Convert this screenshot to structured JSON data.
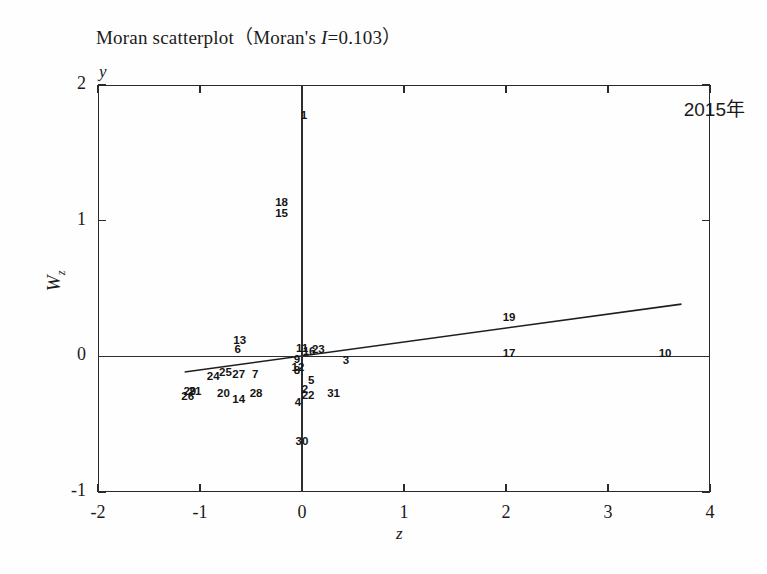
{
  "figure": {
    "title_prefix": "Moran scatterplot",
    "title_open_paren": "（",
    "title_moran": "Moran's ",
    "title_italic_i": "I",
    "title_value": "=0.103",
    "title_close_paren": "）",
    "year_annotation": "2015年",
    "y_corner_letter": "y",
    "x_corner_letter": "z",
    "ylabel_main": "W",
    "ylabel_sub": "z"
  },
  "chart_data": {
    "type": "scatter",
    "title": "Moran scatterplot（Moran's I=0.103）",
    "xlabel": "z",
    "ylabel": "Wz",
    "xlim": [
      -2,
      4
    ],
    "ylim": [
      -1,
      2
    ],
    "xticks": [
      "-2",
      "-1",
      "0",
      "1",
      "2",
      "3",
      "4"
    ],
    "xtick_values": [
      -2,
      -1,
      0,
      1,
      2,
      3,
      4
    ],
    "yticks": [
      "2",
      "1",
      "0",
      "-1"
    ],
    "ytick_values": [
      2,
      1,
      0,
      -1
    ],
    "grid": false,
    "legend": false,
    "morans_i": 0.103,
    "annotation": "2015年",
    "reference_lines": {
      "horizontal_at_y": 0,
      "vertical_at_x": 0
    },
    "regression_line": {
      "x_start": -1.15,
      "y_start": -0.115,
      "x_end": 3.72,
      "y_end": 0.385
    },
    "point_labels": [
      {
        "label": "1",
        "x": 0.02,
        "y": 1.77
      },
      {
        "label": "18",
        "x": -0.2,
        "y": 1.13
      },
      {
        "label": "15",
        "x": -0.2,
        "y": 1.05
      },
      {
        "label": "13",
        "x": -0.61,
        "y": 0.11
      },
      {
        "label": "6",
        "x": -0.63,
        "y": 0.05
      },
      {
        "label": "11",
        "x": 0.0,
        "y": 0.055
      },
      {
        "label": "16",
        "x": 0.07,
        "y": 0.035
      },
      {
        "label": "23",
        "x": 0.16,
        "y": 0.045
      },
      {
        "label": "9",
        "x": -0.05,
        "y": -0.03
      },
      {
        "label": "3",
        "x": 0.43,
        "y": -0.035
      },
      {
        "label": "12",
        "x": -0.04,
        "y": -0.085
      },
      {
        "label": "8",
        "x": -0.05,
        "y": -0.11
      },
      {
        "label": "25",
        "x": -0.75,
        "y": -0.12
      },
      {
        "label": "27",
        "x": -0.62,
        "y": -0.135
      },
      {
        "label": "7",
        "x": -0.46,
        "y": -0.14
      },
      {
        "label": "24",
        "x": -0.87,
        "y": -0.155
      },
      {
        "label": "5",
        "x": 0.09,
        "y": -0.185
      },
      {
        "label": "2",
        "x": 0.03,
        "y": -0.25
      },
      {
        "label": "29",
        "x": -1.1,
        "y": -0.26
      },
      {
        "label": "21",
        "x": -1.05,
        "y": -0.265
      },
      {
        "label": "20",
        "x": -0.77,
        "y": -0.275
      },
      {
        "label": "28",
        "x": -0.45,
        "y": -0.275
      },
      {
        "label": "31",
        "x": 0.31,
        "y": -0.275
      },
      {
        "label": "22",
        "x": 0.06,
        "y": -0.29
      },
      {
        "label": "26",
        "x": -1.12,
        "y": -0.3
      },
      {
        "label": "14",
        "x": -0.62,
        "y": -0.325
      },
      {
        "label": "4",
        "x": -0.04,
        "y": -0.345
      },
      {
        "label": "30",
        "x": 0.0,
        "y": -0.635
      },
      {
        "label": "19",
        "x": 2.03,
        "y": 0.285
      },
      {
        "label": "17",
        "x": 2.03,
        "y": 0.015
      },
      {
        "label": "10",
        "x": 3.56,
        "y": 0.02
      }
    ]
  }
}
